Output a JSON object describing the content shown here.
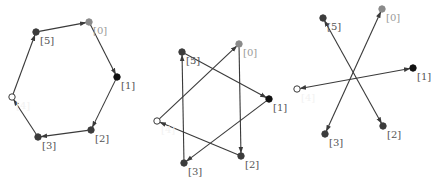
{
  "colors": {
    "edge": "#3a3a3a",
    "node_dark": "#3c3c3c",
    "node_black": "#111111",
    "node_light": "#8a8a8a",
    "node_hollow_fill": "#ffffff",
    "label_dark": "#555555",
    "label_light": "#9a9a9a",
    "label_hidden": "#f2f2f2"
  },
  "diagrams": [
    {
      "id": "hexagon",
      "nodes": [
        {
          "id": 0,
          "label": "[0]",
          "x": 89,
          "y": 22,
          "style": "light"
        },
        {
          "id": 1,
          "label": "[1]",
          "x": 117,
          "y": 77,
          "style": "black"
        },
        {
          "id": 2,
          "label": "[2]",
          "x": 91,
          "y": 130,
          "style": "dark"
        },
        {
          "id": 3,
          "label": "[3]",
          "x": 38,
          "y": 137,
          "style": "dark"
        },
        {
          "id": 4,
          "label": "[4]",
          "x": 12,
          "y": 97,
          "style": "hollow"
        },
        {
          "id": 5,
          "label": "[5]",
          "x": 36,
          "y": 32,
          "style": "dark"
        }
      ],
      "edges": [
        [
          0,
          1
        ],
        [
          1,
          2
        ],
        [
          2,
          3
        ],
        [
          3,
          4
        ],
        [
          4,
          5
        ],
        [
          5,
          0
        ]
      ],
      "edge_mode": "directed"
    },
    {
      "id": "star",
      "nodes": [
        {
          "id": 0,
          "label": "[0]",
          "x": 239,
          "y": 44,
          "style": "light"
        },
        {
          "id": 1,
          "label": "[1]",
          "x": 269,
          "y": 99,
          "style": "black"
        },
        {
          "id": 2,
          "label": "[2]",
          "x": 241,
          "y": 156,
          "style": "dark"
        },
        {
          "id": 3,
          "label": "[3]",
          "x": 184,
          "y": 163,
          "style": "dark"
        },
        {
          "id": 4,
          "label": "[4]",
          "x": 157,
          "y": 121,
          "style": "hollow"
        },
        {
          "id": 5,
          "label": "[5]",
          "x": 182,
          "y": 52,
          "style": "dark"
        }
      ],
      "edges": [
        [
          0,
          2
        ],
        [
          2,
          4
        ],
        [
          4,
          0
        ],
        [
          5,
          1
        ],
        [
          1,
          3
        ],
        [
          3,
          5
        ]
      ],
      "edge_mode": "directed"
    },
    {
      "id": "asterisk",
      "nodes": [
        {
          "id": 0,
          "label": "[0]",
          "x": 382,
          "y": 9,
          "style": "light"
        },
        {
          "id": 1,
          "label": "[1]",
          "x": 413,
          "y": 68,
          "style": "black"
        },
        {
          "id": 2,
          "label": "[2]",
          "x": 383,
          "y": 126,
          "style": "dark"
        },
        {
          "id": 3,
          "label": "[3]",
          "x": 325,
          "y": 134,
          "style": "dark"
        },
        {
          "id": 4,
          "label": "[4]",
          "x": 297,
          "y": 89,
          "style": "hollow"
        },
        {
          "id": 5,
          "label": "[5]",
          "x": 323,
          "y": 18,
          "style": "dark"
        }
      ],
      "edges": [
        [
          0,
          3
        ],
        [
          1,
          4
        ],
        [
          2,
          5
        ]
      ],
      "edge_mode": "bidirectional"
    }
  ]
}
